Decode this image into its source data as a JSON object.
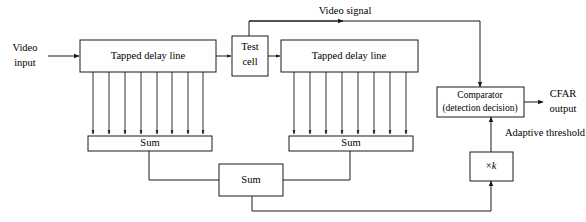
{
  "diagram": {
    "colors": {
      "stroke": "#1a1a1a",
      "background": "#ffffff",
      "text": "#000000"
    },
    "blocks": {
      "tapped_delay_left": "Tapped delay line",
      "test_cell_line1": "Test",
      "test_cell_line2": "cell",
      "tapped_delay_right": "Tapped delay line",
      "sum_left": "Sum",
      "sum_right": "Sum",
      "sum_bottom": "Sum",
      "comparator_line1": "Comparator",
      "comparator_line2": "(detection decision)",
      "multiplier_prefix": "×",
      "multiplier_factor": "k"
    },
    "labels": {
      "video_input_line1": "Video",
      "video_input_line2": "input",
      "video_signal": "Video signal",
      "cfar_output_line1": "CFAR",
      "cfar_output_line2": "output",
      "adaptive_threshold": "Adaptive threshold"
    },
    "taps": {
      "left_count": 8,
      "right_count": 8
    }
  }
}
